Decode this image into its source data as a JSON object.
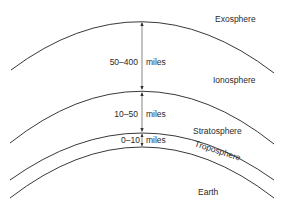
{
  "diagram": {
    "type": "atmosphere-layers",
    "layers": [
      {
        "name": "Exosphere"
      },
      {
        "name": "Ionosphere"
      },
      {
        "name": "Stratosphere"
      },
      {
        "name": "Troposphere"
      },
      {
        "name": "Earth"
      }
    ],
    "ranges": [
      {
        "value": "50–400",
        "unit": "miles"
      },
      {
        "value": "10–50",
        "unit": "miles"
      },
      {
        "value": "0–10",
        "unit": "miles"
      }
    ],
    "colors": {
      "line": "#222222",
      "text": "#2a2a2a",
      "background": "#ffffff"
    }
  }
}
